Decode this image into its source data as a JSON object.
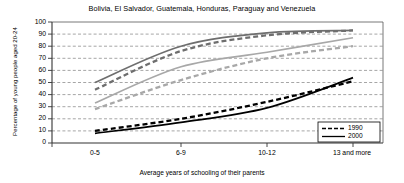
{
  "chart_data": {
    "type": "line",
    "title": "Bolivia, El Salvador, Guatemala, Honduras, Paraguay and Venezuela",
    "xlabel": "Average years of schooling of their parents",
    "ylabel": "Percentage of young people aged 20-24",
    "categories": [
      "0-5",
      "6-9",
      "10-12",
      "13 and more"
    ],
    "ylim": [
      0,
      100
    ],
    "yticks": [
      "0",
      "10",
      "20",
      "30",
      "40",
      "50",
      "60",
      "70",
      "80",
      "90",
      "100"
    ],
    "grid": true,
    "legend_position": "bottom-right",
    "legend": [
      {
        "name": "1990",
        "style": "dashed"
      },
      {
        "name": "2000",
        "style": "solid"
      }
    ],
    "series": [
      {
        "name": "Primary completion 2000",
        "year": "2000",
        "style": "solid",
        "color": "#6e6e6e",
        "x": [
          0,
          1,
          2,
          3
        ],
        "values": [
          50,
          80,
          91,
          93
        ]
      },
      {
        "name": "Primary completion 1990",
        "year": "1990",
        "style": "dashed",
        "color": "#6e6e6e",
        "x": [
          0,
          1,
          2,
          3
        ],
        "values": [
          44,
          76,
          89,
          93
        ]
      },
      {
        "name": "Secondary completion 2000",
        "year": "2000",
        "style": "solid",
        "color": "#a8a8a8",
        "x": [
          0,
          1,
          2,
          3
        ],
        "values": [
          33,
          63,
          75,
          87
        ]
      },
      {
        "name": "Secondary completion 1990",
        "year": "1990",
        "style": "dashed",
        "color": "#a8a8a8",
        "x": [
          0,
          1,
          2,
          3
        ],
        "values": [
          28,
          52,
          70,
          80
        ]
      },
      {
        "name": "Tertiary completion 2000",
        "year": "2000",
        "style": "solid",
        "color": "#000000",
        "x": [
          0,
          1,
          2,
          3
        ],
        "values": [
          8,
          17,
          29,
          54
        ]
      },
      {
        "name": "Tertiary completion 1990",
        "year": "1990",
        "style": "dashed",
        "color": "#000000",
        "x": [
          0,
          1,
          2,
          3
        ],
        "values": [
          10,
          20,
          34,
          51
        ]
      }
    ]
  }
}
